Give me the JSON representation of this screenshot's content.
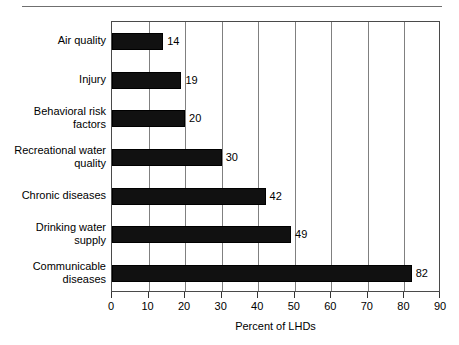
{
  "figure": {
    "has_top_rule": true,
    "background": "#ffffff",
    "bar_color": "#111111",
    "grid_color": "#808080",
    "axis_color": "#4a4a4a"
  },
  "chart_data": {
    "type": "bar",
    "orientation": "horizontal",
    "title": "",
    "subtitle": "",
    "xlabel": "Percent of LHDs",
    "ylabel": "",
    "xlim": [
      0,
      90
    ],
    "xticks": [
      0,
      10,
      20,
      30,
      40,
      50,
      60,
      70,
      80,
      90
    ],
    "xtick_labels": [
      "0",
      "10",
      "20",
      "30",
      "40",
      "50",
      "60",
      "70",
      "80",
      "90"
    ],
    "grid": "vertical",
    "legend": "none",
    "categories": [
      "Air quality",
      "Injury",
      "Behavioral risk factors",
      "Recreational water quality",
      "Chronic diseases",
      "Drinking water supply",
      "Communicable diseases"
    ],
    "category_lines": [
      [
        "Air quality"
      ],
      [
        "Injury"
      ],
      [
        "Behavioral risk",
        "factors"
      ],
      [
        "Recreational water",
        "quality"
      ],
      [
        "Chronic diseases"
      ],
      [
        "Drinking water",
        "supply"
      ],
      [
        "Communicable",
        "diseases"
      ]
    ],
    "values": [
      14,
      19,
      20,
      30,
      42,
      49,
      82
    ],
    "data_labels": [
      "14",
      "19",
      "20",
      "30",
      "42",
      "49",
      "82"
    ]
  }
}
